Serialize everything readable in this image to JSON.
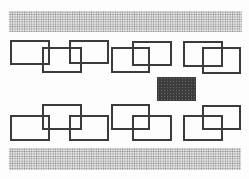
{
  "diagram": {
    "type": "room-layout",
    "bands": [
      {
        "id": "top-band",
        "x": 9,
        "y": 11,
        "w": 233,
        "h": 21,
        "pattern": "dotted"
      },
      {
        "id": "bottom-band",
        "x": 9,
        "y": 148,
        "w": 232,
        "h": 22,
        "pattern": "dotted"
      }
    ],
    "tables": [
      {
        "id": 1,
        "x": 10,
        "y": 40,
        "w": 40,
        "h": 25
      },
      {
        "id": 2,
        "x": 42,
        "y": 47,
        "w": 40,
        "h": 26
      },
      {
        "id": 3,
        "x": 69,
        "y": 40,
        "w": 40,
        "h": 24
      },
      {
        "id": 4,
        "x": 111,
        "y": 47,
        "w": 39,
        "h": 26
      },
      {
        "id": 5,
        "x": 132,
        "y": 41,
        "w": 40,
        "h": 25
      },
      {
        "id": 6,
        "x": 183,
        "y": 41,
        "w": 40,
        "h": 26
      },
      {
        "id": 7,
        "x": 202,
        "y": 47,
        "w": 39,
        "h": 27
      },
      {
        "id": 8,
        "x": 10,
        "y": 115,
        "w": 40,
        "h": 26
      },
      {
        "id": 9,
        "x": 42,
        "y": 104,
        "w": 40,
        "h": 26
      },
      {
        "id": 10,
        "x": 69,
        "y": 115,
        "w": 40,
        "h": 26
      },
      {
        "id": 11,
        "x": 111,
        "y": 104,
        "w": 39,
        "h": 26
      },
      {
        "id": 12,
        "x": 132,
        "y": 115,
        "w": 40,
        "h": 26
      },
      {
        "id": 13,
        "x": 183,
        "y": 115,
        "w": 40,
        "h": 26
      },
      {
        "id": 14,
        "x": 202,
        "y": 105,
        "w": 39,
        "h": 25
      }
    ],
    "center_block": {
      "x": 157,
      "y": 77,
      "w": 39,
      "h": 24,
      "color": "#3d3d3d"
    },
    "colors": {
      "outline": "#3b3b3b",
      "band": "#e6e6e6",
      "background": "#fdfdfd"
    }
  }
}
